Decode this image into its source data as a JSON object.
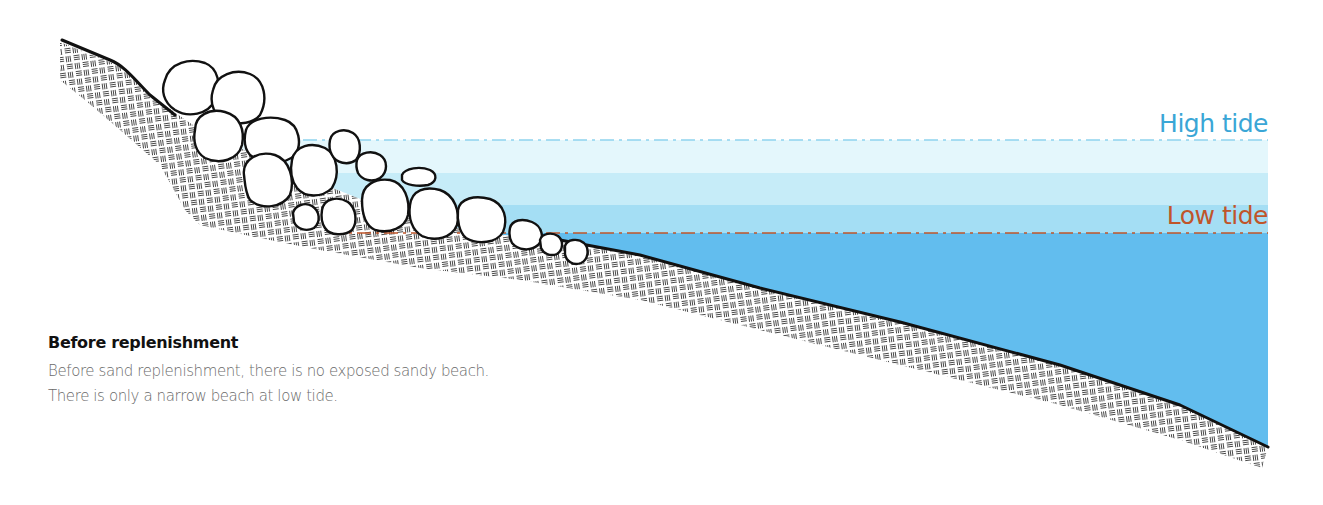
{
  "labels": {
    "high_tide": "High tide",
    "low_tide": "Low tide"
  },
  "caption": {
    "title": "Before replenishment",
    "lines": [
      "Before sand replenishment, there is no exposed sandy beach.",
      "There is only a narrow beach at low tide."
    ]
  },
  "colors": {
    "high_tide_text": "#3aa6d6",
    "low_tide_text": "#c0552a",
    "water_band_1": "#e4f7fc",
    "water_band_2": "#c6ecf8",
    "water_band_3": "#a4def4",
    "water_deep": "#62bdee",
    "high_tide_line": "#8fd3ee",
    "low_tide_line": "#c0552a"
  },
  "elements": {
    "seawall_boulders": "boulder-revetment",
    "ground": "rock-substrate-hatch"
  }
}
